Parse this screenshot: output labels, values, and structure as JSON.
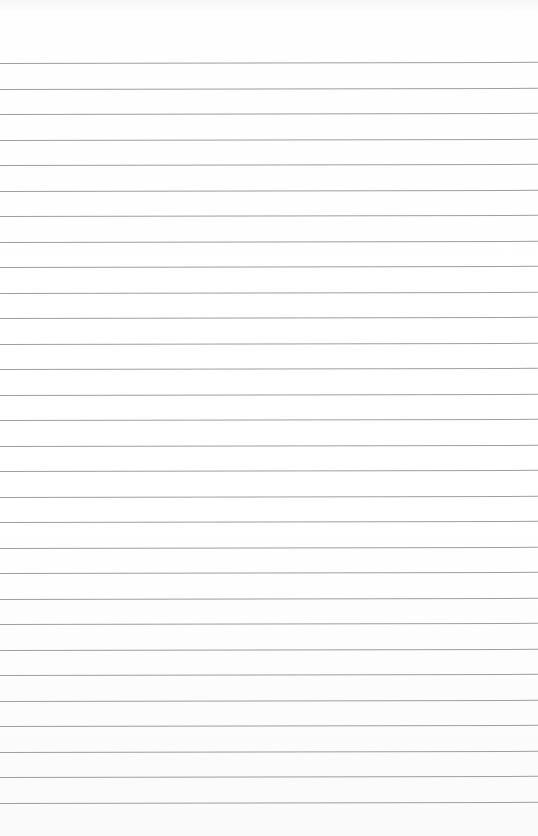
{
  "paper": {
    "type": "lined-paper",
    "background_color": "#ffffff",
    "line_color": "#8e8e8e",
    "first_line_y": 63,
    "line_spacing": 25.5,
    "line_count": 30
  }
}
